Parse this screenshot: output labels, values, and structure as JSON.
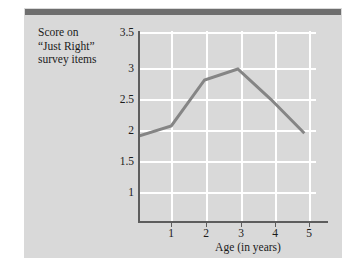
{
  "figure": {
    "background_color": "#d9d9d9",
    "top_rule_color": "#6e6e6e"
  },
  "chart_data": {
    "type": "line",
    "title": "",
    "ylabel": "Score on “Just Right” survey items",
    "ylabel_lines": [
      "Score on",
      "“Just Right”",
      "survey items"
    ],
    "xlabel": "Age (in years)",
    "x": [
      0,
      1,
      2,
      3,
      4,
      5
    ],
    "values": [
      1.95,
      2.12,
      2.87,
      3.05,
      2.55,
      2.0
    ],
    "series": [
      {
        "name": "Score on “Just Right” survey items",
        "values": [
          1.95,
          2.12,
          2.87,
          3.05,
          2.55,
          2.0
        ],
        "color": "#858585"
      }
    ],
    "xlim": [
      0,
      5.35
    ],
    "ylim": [
      0.55,
      3.67
    ],
    "xticks": [
      1,
      2,
      3,
      4,
      5
    ],
    "xtick_labels": [
      "1",
      "2",
      "3",
      "4",
      "5"
    ],
    "yticks": [
      1,
      1.5,
      2,
      2.5,
      3,
      3.5
    ],
    "ytick_labels": [
      "1",
      "1.5",
      "2",
      "2.5",
      "3",
      "3.5"
    ],
    "grid": true,
    "grid_color": "#ffffff",
    "legend": false,
    "legend_position": "none",
    "line_color": "#858585",
    "line_width": 3,
    "markers": false,
    "annotations": []
  }
}
